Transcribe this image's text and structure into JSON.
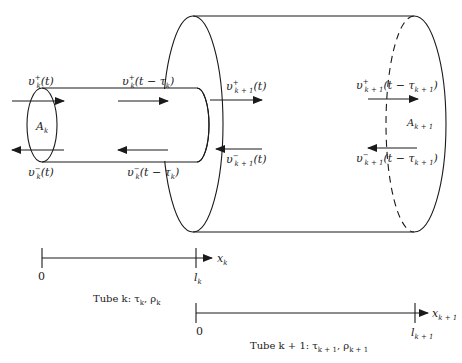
{
  "diagram": {
    "type": "acoustic-tube-junction",
    "tube_k": {
      "area_label": "A",
      "area_sub": "k",
      "forward_in": {
        "v": "υ",
        "sup": "+",
        "sub": "k",
        "arg": "(t)"
      },
      "forward_out": {
        "v": "υ",
        "sup": "+",
        "sub": "k",
        "arg": "(t − τ",
        "arg_sub": "k",
        "arg_end": ")"
      },
      "backward_in": {
        "v": "υ",
        "sup": "−",
        "sub": "k",
        "arg": "(t)"
      },
      "backward_out": {
        "v": "υ",
        "sup": "−",
        "sub": "k",
        "arg": "(t − τ",
        "arg_sub": "k",
        "arg_end": ")"
      },
      "caption": "Tube k:  τ",
      "caption_tau_sub": "k",
      "caption_rho": ", ρ",
      "caption_rho_sub": "k"
    },
    "tube_k1": {
      "area_label": "A",
      "area_sub": "k + 1",
      "forward_in": {
        "v": "υ",
        "sup": "+",
        "sub": "k + 1",
        "arg": "(t)"
      },
      "forward_out": {
        "v": "υ",
        "sup": "+",
        "sub": "k + 1",
        "arg": "(t − τ",
        "arg_sub": "k + 1",
        "arg_end": ")"
      },
      "backward_in": {
        "v": "υ",
        "sup": "−",
        "sub": "k + 1",
        "arg": "(t)"
      },
      "backward_out": {
        "v": "υ",
        "sup": "−",
        "sub": "k + 1",
        "arg": "(t − τ",
        "arg_sub": "k + 1",
        "arg_end": ")"
      },
      "caption": "Tube k + 1:  τ",
      "caption_tau_sub": "k + 1",
      "caption_rho": ", ρ",
      "caption_rho_sub": "k + 1"
    },
    "axis_k": {
      "origin": "0",
      "end_label": "l",
      "end_sub": "k",
      "var": "x",
      "var_sub": "k"
    },
    "axis_k1": {
      "origin": "0",
      "end_label": "l",
      "end_sub": "k + 1",
      "var": "x",
      "var_sub": "k + 1"
    },
    "colors": {
      "stroke": "#1a1a1a",
      "background": "#ffffff"
    }
  }
}
